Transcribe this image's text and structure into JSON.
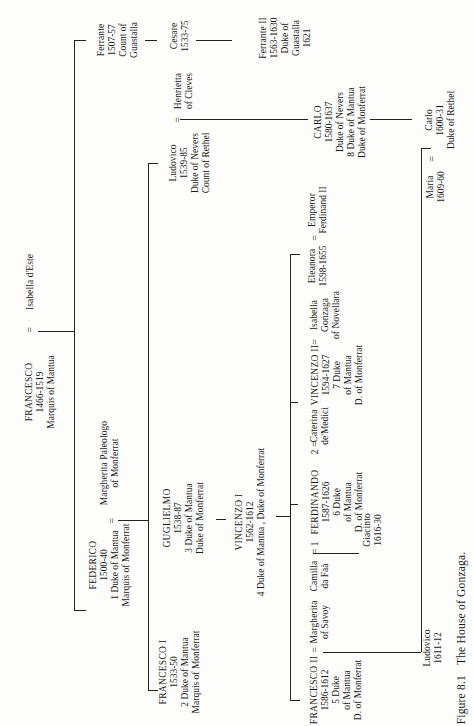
{
  "figure": {
    "number": "Figure 8.1",
    "title": "The House of Gonzaga."
  },
  "people": {
    "francesco": {
      "name": "FRANCESCO",
      "lines": [
        "1466-1519",
        "Marquis of Mantua"
      ]
    },
    "isabella_deste": {
      "name": "Isabella d'Este",
      "lines": []
    },
    "federico": {
      "name": "FEDERICO",
      "lines": [
        "1500-40",
        "1 Duke of Mantua",
        "Marquis of Monferrat"
      ]
    },
    "margherita_paleologo": {
      "name": "Margherita Paleologo",
      "lines": [
        "of Monferrat"
      ]
    },
    "ferrante": {
      "name": "Ferrante",
      "lines": [
        "1507-57",
        "Count of",
        "Guastalla"
      ]
    },
    "cesare": {
      "name": "Cesare",
      "lines": [
        "1533-75"
      ]
    },
    "ferrante_ii": {
      "name": "Ferrante II",
      "lines": [
        "1563-1630",
        "Duke of",
        "Guastalla",
        "1621"
      ]
    },
    "francesco_i": {
      "name": "FRANCESCO I",
      "lines": [
        "1533-50",
        "2 Duke of Mantua",
        "Marquis of Monferrat"
      ]
    },
    "guglielmo": {
      "name": "GUGLIELMO",
      "lines": [
        "1538-87",
        "3 Duke of Mantua",
        "Duke of Monferrat"
      ]
    },
    "ludovico_nevers": {
      "name": "Ludovico",
      "lines": [
        "1539-85",
        "Duke of Nevers",
        "Count of Rethel"
      ]
    },
    "henrietta": {
      "name": "Henrietta",
      "lines": [
        "of Cleves"
      ]
    },
    "vincenzo_i": {
      "name": "VINCENZO I",
      "lines": [
        "1562-1612",
        "4 Duke of Mantua , Duke of Monferrat"
      ]
    },
    "carlo_nevers": {
      "name": "CARLO",
      "lines": [
        "1580-1637",
        "Duke of Nevers",
        "8 Duke of Mantua",
        "Duke of Monferrat"
      ]
    },
    "francesco_ii": {
      "name": "FRANCESCO II",
      "lines": [
        "1586-1612",
        "5 Duke",
        "of Mantua",
        "D. of Monferrat"
      ]
    },
    "margherita_savoy": {
      "name": "Margherita",
      "lines": [
        "of Savoy"
      ]
    },
    "camilla": {
      "name": "Camilla",
      "lines": [
        "da Faà"
      ]
    },
    "ferdinando": {
      "name": "FERDINANDO",
      "lines": [
        "1587-1626",
        "6 Duke",
        "of Mantua",
        "D. of Monferrat"
      ]
    },
    "caterina": {
      "name": "Caterina",
      "lines": [
        "de'Medici"
      ]
    },
    "vincenzo_ii": {
      "name": "VINCENZO II",
      "lines": [
        "1594-1627",
        "7 Duke",
        "of Mantua",
        "D. of Monferrat"
      ]
    },
    "isabella_gonzaga": {
      "name": "Isabella",
      "lines": [
        "Gonzaga",
        "of Novellara"
      ]
    },
    "eleanora": {
      "name": "Eleanora",
      "lines": [
        "1598-1655"
      ]
    },
    "emperor": {
      "name": "Emperor",
      "lines": [
        "Ferdinand II"
      ]
    },
    "giacinto": {
      "name": "Giacinto",
      "lines": [
        "1616-30"
      ]
    },
    "ludovico_infant": {
      "name": "Ludovico",
      "lines": [
        "1611-12"
      ]
    },
    "maria": {
      "name": "Maria",
      "lines": [
        "1609-60"
      ]
    },
    "carlo_rethel": {
      "name": "Carlo",
      "lines": [
        "1600-31",
        "Duke of Rethel"
      ]
    }
  },
  "marriage_marks": {
    "eq": "=",
    "eq1": "= 1",
    "eq2": "2 ="
  },
  "colors": {
    "ink": "#1a1a1a",
    "paper": "#fdfdfc"
  }
}
